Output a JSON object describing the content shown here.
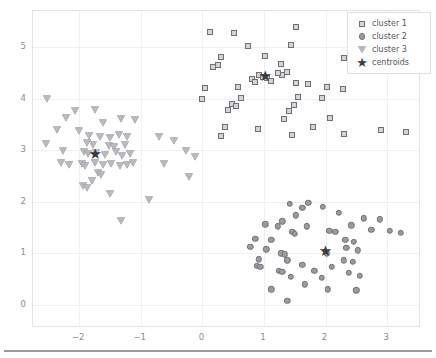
{
  "axes": {
    "xticks": [
      "−2",
      "−1",
      "0",
      "1",
      "2",
      "3"
    ],
    "yticks": [
      "0",
      "1",
      "2",
      "3",
      "4",
      "5"
    ]
  },
  "legend": {
    "entries": [
      {
        "label": "cluster 1",
        "marker": "square-marker"
      },
      {
        "label": "cluster 2",
        "marker": "circle-marker"
      },
      {
        "label": "cluster 3",
        "marker": "triangle-down-marker"
      },
      {
        "label": "centroids",
        "marker": "star-marker"
      }
    ]
  },
  "chart_data": {
    "type": "scatter",
    "title": "",
    "xlabel": "",
    "ylabel": "",
    "xlim": [
      -2.75,
      3.55
    ],
    "ylim": [
      -0.45,
      5.7
    ],
    "grid": true,
    "legend_position": "upper right",
    "colors": {
      "marker_edge": "#6f6f76",
      "cluster1_face": "#d3d3d8",
      "cluster2_face": "#9b9ba2",
      "cluster3_face": "#b9b9c0",
      "centroid": "#3b3b40",
      "grid": "#f0f0f2",
      "frame": "#e3e3e6",
      "tick_text": "#8a8a90"
    },
    "series": [
      {
        "name": "cluster 1",
        "marker": "square",
        "points": [
          [
            0.12,
            5.3
          ],
          [
            0.52,
            5.28
          ],
          [
            1.52,
            5.38
          ],
          [
            2.52,
            5.33
          ],
          [
            0.74,
            5.02
          ],
          [
            1.44,
            5.04
          ],
          [
            2.66,
            5.0
          ],
          [
            0.3,
            4.8
          ],
          [
            1.02,
            4.83
          ],
          [
            2.3,
            4.78
          ],
          [
            0.18,
            4.62
          ],
          [
            0.25,
            4.66
          ],
          [
            1.28,
            4.68
          ],
          [
            1.38,
            4.52
          ],
          [
            1.3,
            4.45
          ],
          [
            1.22,
            4.5
          ],
          [
            0.92,
            4.46
          ],
          [
            0.98,
            4.42
          ],
          [
            1.05,
            4.4
          ],
          [
            0.8,
            4.38
          ],
          [
            0.86,
            4.33
          ],
          [
            1.12,
            4.35
          ],
          [
            0.58,
            4.22
          ],
          [
            1.52,
            4.3
          ],
          [
            1.72,
            4.28
          ],
          [
            0.04,
            4.2
          ],
          [
            2.02,
            4.22
          ],
          [
            2.28,
            4.18
          ],
          [
            0.0,
            4.0
          ],
          [
            0.62,
            4.02
          ],
          [
            1.56,
            4.04
          ],
          [
            1.94,
            4.02
          ],
          [
            0.48,
            3.9
          ],
          [
            0.55,
            3.86
          ],
          [
            1.48,
            3.88
          ],
          [
            0.42,
            3.78
          ],
          [
            1.4,
            3.76
          ],
          [
            1.32,
            3.6
          ],
          [
            2.08,
            3.62
          ],
          [
            0.36,
            3.44
          ],
          [
            0.9,
            3.42
          ],
          [
            1.8,
            3.44
          ],
          [
            0.3,
            3.28
          ],
          [
            2.9,
            3.4
          ],
          [
            3.3,
            3.36
          ],
          [
            1.46,
            3.3
          ],
          [
            2.3,
            3.32
          ]
        ],
        "centroid": [
          1.02,
          4.42
        ]
      },
      {
        "name": "cluster 2",
        "marker": "circle",
        "points": [
          [
            1.42,
            1.96
          ],
          [
            1.72,
            1.98
          ],
          [
            1.62,
            1.88
          ],
          [
            1.96,
            1.9
          ],
          [
            1.52,
            1.74
          ],
          [
            2.22,
            1.78
          ],
          [
            1.3,
            1.62
          ],
          [
            2.62,
            1.68
          ],
          [
            2.88,
            1.66
          ],
          [
            1.02,
            1.56
          ],
          [
            1.22,
            1.52
          ],
          [
            1.7,
            1.52
          ],
          [
            2.42,
            1.54
          ],
          [
            1.46,
            1.42
          ],
          [
            1.5,
            1.38
          ],
          [
            2.06,
            1.44
          ],
          [
            2.16,
            1.42
          ],
          [
            2.74,
            1.46
          ],
          [
            3.04,
            1.44
          ],
          [
            3.22,
            1.4
          ],
          [
            0.86,
            1.28
          ],
          [
            1.12,
            1.26
          ],
          [
            2.32,
            1.26
          ],
          [
            2.46,
            1.22
          ],
          [
            0.78,
            1.12
          ],
          [
            1.04,
            1.08
          ],
          [
            2.34,
            1.1
          ],
          [
            2.52,
            1.06
          ],
          [
            1.28,
            1.0
          ],
          [
            1.34,
            0.98
          ],
          [
            2.02,
            1.0
          ],
          [
            0.92,
            0.88
          ],
          [
            1.38,
            0.86
          ],
          [
            2.3,
            0.86
          ],
          [
            2.44,
            0.84
          ],
          [
            0.88,
            0.76
          ],
          [
            0.94,
            0.74
          ],
          [
            1.62,
            0.78
          ],
          [
            2.1,
            0.74
          ],
          [
            1.24,
            0.66
          ],
          [
            1.3,
            0.64
          ],
          [
            1.82,
            0.66
          ],
          [
            2.38,
            0.62
          ],
          [
            1.44,
            0.54
          ],
          [
            1.94,
            0.52
          ],
          [
            2.56,
            0.56
          ],
          [
            1.66,
            0.4
          ],
          [
            1.12,
            0.3
          ],
          [
            2.04,
            0.3
          ],
          [
            2.5,
            0.28
          ],
          [
            1.38,
            0.08
          ]
        ],
        "centroid": [
          2.0,
          1.02
        ]
      },
      {
        "name": "cluster 3",
        "marker": "triangle-down",
        "points": [
          [
            -2.52,
            4.0
          ],
          [
            -2.06,
            3.76
          ],
          [
            -1.74,
            3.78
          ],
          [
            -2.22,
            3.62
          ],
          [
            -1.32,
            3.6
          ],
          [
            -1.1,
            3.58
          ],
          [
            -1.62,
            3.52
          ],
          [
            -2.36,
            3.4
          ],
          [
            -2.0,
            3.38
          ],
          [
            -1.84,
            3.28
          ],
          [
            -1.66,
            3.26
          ],
          [
            -1.5,
            3.24
          ],
          [
            -1.36,
            3.3
          ],
          [
            -1.22,
            3.26
          ],
          [
            -0.7,
            3.26
          ],
          [
            -0.46,
            3.18
          ],
          [
            -2.54,
            3.12
          ],
          [
            -1.88,
            3.14
          ],
          [
            -1.78,
            3.1
          ],
          [
            -1.52,
            3.08
          ],
          [
            -1.44,
            3.06
          ],
          [
            -1.26,
            3.1
          ],
          [
            -2.26,
            2.98
          ],
          [
            -1.92,
            2.96
          ],
          [
            -1.86,
            2.92
          ],
          [
            -1.72,
            2.94
          ],
          [
            -1.58,
            2.9
          ],
          [
            -1.4,
            2.96
          ],
          [
            -1.3,
            2.88
          ],
          [
            -1.18,
            2.92
          ],
          [
            -0.26,
            2.98
          ],
          [
            -0.12,
            2.86
          ],
          [
            -2.3,
            2.76
          ],
          [
            -2.16,
            2.72
          ],
          [
            -1.96,
            2.74
          ],
          [
            -1.9,
            2.7
          ],
          [
            -1.74,
            2.76
          ],
          [
            -1.62,
            2.72
          ],
          [
            -1.48,
            2.74
          ],
          [
            -1.34,
            2.7
          ],
          [
            -1.22,
            2.72
          ],
          [
            -1.12,
            2.76
          ],
          [
            -0.62,
            2.74
          ],
          [
            -1.7,
            2.56
          ],
          [
            -1.64,
            2.52
          ],
          [
            -1.8,
            2.4
          ],
          [
            -1.94,
            2.3
          ],
          [
            -1.88,
            2.26
          ],
          [
            -1.5,
            2.14
          ],
          [
            -0.86,
            2.04
          ],
          [
            -0.22,
            2.48
          ],
          [
            -1.32,
            1.62
          ]
        ],
        "centroid": [
          -1.74,
          2.9
        ]
      }
    ]
  }
}
